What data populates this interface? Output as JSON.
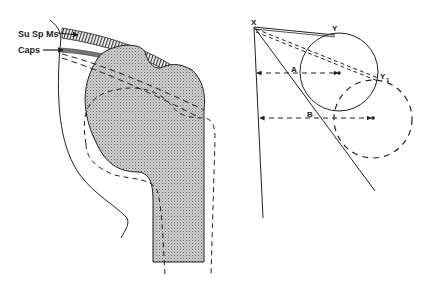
{
  "figure": {
    "left_panel": {
      "title": "Shoulder joint cross-section (humeral head, capsule, supraspinatus)",
      "labels": {
        "supraspinatus": "Su Sp Ms",
        "capsule": "Caps"
      }
    },
    "right_panel": {
      "title": "Geometric diagram of tangent lines to circle",
      "labels": {
        "origin": "X",
        "tangent_point": "Y",
        "tangent_point_displaced": "Y",
        "tangent_point_displaced_sub": "1",
        "distance_a": "A",
        "distance_b": "B"
      }
    },
    "colors": {
      "ink": "#222222",
      "shade": "#bdbdbd",
      "background": "#ffffff"
    }
  }
}
